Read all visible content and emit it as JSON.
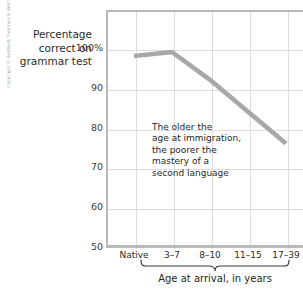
{
  "figure": {
    "copyright_text": "Copyright © Bedford, Freeman & Worth — All rights reserved.",
    "line_color": "#a8a8a8",
    "grid_color": "#dcdcdc",
    "axis_color": "#b9b9b9",
    "text_color": "#1f1f1f"
  },
  "ytitle": {
    "line1": "Percentage",
    "line2": "correct on",
    "line3": "grammar test"
  },
  "annotation": {
    "line1": "The older the",
    "line2": "age at immigration,",
    "line3": "the poorer the",
    "line4": "mastery of a",
    "line5": "second language"
  },
  "chart_data": {
    "type": "line",
    "title": "",
    "xlabel": "Age at arrival, in years",
    "ylabel": "Percentage correct on grammar test",
    "categories": [
      "Native",
      "3–7",
      "8–10",
      "11–15",
      "17–39"
    ],
    "values": [
      98,
      99,
      92,
      84,
      76
    ],
    "ytick_labels": [
      "100%",
      "90",
      "80",
      "70",
      "60",
      "50"
    ],
    "ytick_values": [
      100,
      90,
      80,
      70,
      60,
      50
    ],
    "ylim": [
      50,
      100
    ],
    "grid": true,
    "legend": "none",
    "series": [
      {
        "name": "Percentage correct on grammar test",
        "values": [
          98,
          99,
          92,
          84,
          76
        ]
      }
    ],
    "brace_span": [
      "3–7",
      "17–39"
    ]
  }
}
